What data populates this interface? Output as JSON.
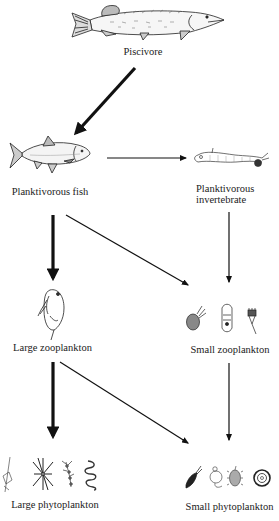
{
  "diagram": {
    "type": "food-web",
    "colors": {
      "ink": "#111111",
      "background": "#ffffff",
      "text": "#222222"
    },
    "nodes": [
      {
        "id": "piscivore",
        "label": "Piscivore",
        "icon": "pike-icon"
      },
      {
        "id": "planktivorous_fish",
        "label": "Planktivorous fish",
        "icon": "roach-fish-icon"
      },
      {
        "id": "planktivorous_invertebrate",
        "label_line1": "Planktivorous",
        "label_line2": "invertebrate",
        "icon": "chaoborus-larva-icon"
      },
      {
        "id": "large_zooplankton",
        "label": "Large zooplankton",
        "icon": "daphnia-icon"
      },
      {
        "id": "small_zooplankton",
        "label": "Small zooplankton",
        "icons": [
          "small-cladoceran-icon",
          "rotifer-icon",
          "rotifer-keratella-icon"
        ]
      },
      {
        "id": "large_phytoplankton",
        "label": "Large phytoplankton",
        "icons": [
          "colonial-algae-icon",
          "asterionella-star-icon",
          "filamentous-algae-icon",
          "spiral-cyanobacteria-icon"
        ]
      },
      {
        "id": "small_phytoplankton",
        "label": "Small phytoplankton",
        "icons": [
          "flagellate-icon",
          "chlamydomonas-icon",
          "ciliated-cell-icon",
          "centric-diatom-icon"
        ]
      }
    ],
    "edges": [
      {
        "from": "piscivore",
        "to": "planktivorous_fish",
        "weight": "thick"
      },
      {
        "from": "planktivorous_fish",
        "to": "planktivorous_invertebrate",
        "weight": "thin"
      },
      {
        "from": "planktivorous_fish",
        "to": "large_zooplankton",
        "weight": "thick"
      },
      {
        "from": "planktivorous_fish",
        "to": "small_zooplankton",
        "weight": "thin"
      },
      {
        "from": "planktivorous_invertebrate",
        "to": "small_zooplankton",
        "weight": "thin"
      },
      {
        "from": "large_zooplankton",
        "to": "large_phytoplankton",
        "weight": "thick"
      },
      {
        "from": "large_zooplankton",
        "to": "small_phytoplankton",
        "weight": "thin"
      },
      {
        "from": "small_zooplankton",
        "to": "small_phytoplankton",
        "weight": "thin"
      }
    ]
  }
}
